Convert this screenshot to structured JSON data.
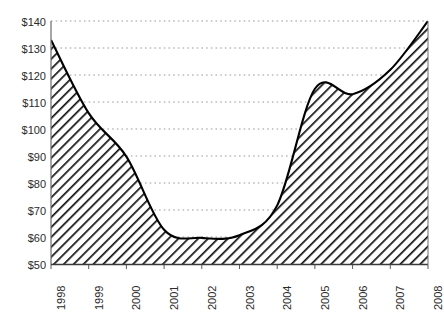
{
  "chart_data": {
    "type": "area",
    "title": "",
    "subtitle": "",
    "xlabel": "",
    "ylabel": "",
    "categories": [
      "1998",
      "1999",
      "2000",
      "2001",
      "2002",
      "2003",
      "2004",
      "2005",
      "2006",
      "2007",
      "2008"
    ],
    "values": [
      133,
      106,
      90,
      63,
      60,
      61,
      72,
      115,
      113,
      122,
      140
    ],
    "x": [
      1998,
      1999,
      2000,
      2001,
      2002,
      2003,
      2004,
      2005,
      2006,
      2007,
      2008
    ],
    "ylim": [
      50,
      140
    ],
    "xlim": [
      1998,
      2008
    ],
    "y_ticks": [
      140,
      130,
      120,
      110,
      100,
      90,
      80,
      70,
      60,
      50
    ],
    "y_tick_labels": [
      "$140",
      "$130",
      "$120",
      "$110",
      "$100",
      "$90",
      "$80",
      "$70",
      "$60",
      "$50"
    ],
    "x_tick_labels": [
      "1998",
      "1999",
      "2000",
      "2001",
      "2002",
      "2003",
      "2004",
      "2005",
      "2006",
      "2007",
      "2008"
    ],
    "grid": "horizontal-dotted",
    "legend": "none",
    "fill": "diagonal-hatch",
    "line_color": "#000000",
    "grid_color": "#9a9a9a",
    "axis_color": "#5a5a5a",
    "series": [
      {
        "name": "series-1",
        "values": [
          133,
          106,
          90,
          63,
          60,
          61,
          72,
          115,
          113,
          122,
          140
        ]
      }
    ],
    "annotations": []
  }
}
